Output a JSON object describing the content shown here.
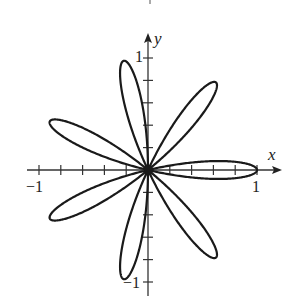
{
  "chart_data": {
    "type": "line",
    "subtype": "polar-rose",
    "equation": "r = cos(7θ)",
    "petals": 7,
    "petal_angles_deg": [
      0,
      51.43,
      102.86,
      154.29,
      205.71,
      257.14,
      308.57
    ],
    "amplitude": 1,
    "title": "",
    "xlabel": "x",
    "ylabel": "y",
    "xlim": [
      -1,
      1
    ],
    "ylim": [
      -1,
      1
    ],
    "x_tick_step": 0.2,
    "y_tick_step": 0.2,
    "x_tick_labels": [
      {
        "value": -1,
        "label": "−1"
      },
      {
        "value": 1,
        "label": "1"
      }
    ],
    "y_tick_labels": [
      {
        "value": 1,
        "label": "1"
      },
      {
        "value": -1,
        "label": "−1"
      }
    ],
    "grid": false,
    "legend": null,
    "line_color": "#1a1a1a",
    "axis_color": "#333333"
  },
  "labels": {
    "x_axis": "x",
    "y_axis": "y",
    "x_pos_one": "1",
    "x_neg_one": "−1",
    "y_pos_one": "1",
    "y_neg_one": "−1"
  }
}
